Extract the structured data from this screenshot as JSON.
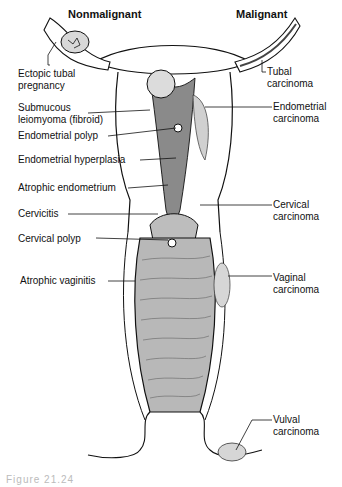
{
  "headers": {
    "left": "Nonmalignant",
    "right": "Malignant"
  },
  "labels_left": [
    {
      "lines": [
        "Ectopic tubal",
        "pregnancy"
      ]
    },
    {
      "lines": [
        "Submucous",
        "leiomyoma (fibroid)"
      ]
    },
    {
      "lines": [
        "Endometrial polyp"
      ]
    },
    {
      "lines": [
        "Endometrial hyperplasia"
      ]
    },
    {
      "lines": [
        "Atrophic endometrium"
      ]
    },
    {
      "lines": [
        "Cervicitis"
      ]
    },
    {
      "lines": [
        "Cervical polyp"
      ]
    },
    {
      "lines": [
        "Atrophic vaginitis"
      ]
    }
  ],
  "labels_right": [
    {
      "lines": [
        "Tubal",
        "carcinoma"
      ]
    },
    {
      "lines": [
        "Endometrial",
        "carcinoma"
      ]
    },
    {
      "lines": [
        "Cervical",
        "carcinoma"
      ]
    },
    {
      "lines": [
        "Vaginal",
        "carcinoma"
      ]
    },
    {
      "lines": [
        "Vulval",
        "carcinoma"
      ]
    }
  ],
  "caption": "Figure 21.24",
  "colors": {
    "ink": "#111111",
    "tissue_shade": "#b8b8b8",
    "dark_shade": "#6e6e6e",
    "background": "#ffffff"
  }
}
